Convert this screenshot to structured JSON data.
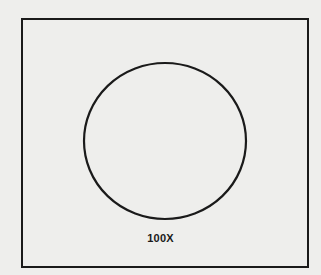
{
  "diagram": {
    "magnification_label": "100X",
    "shapes": [
      {
        "type": "rectangle",
        "role": "frame",
        "x": 21,
        "y": 18,
        "width": 286,
        "height": 248
      },
      {
        "type": "circle",
        "role": "field-of-view",
        "cx": 165,
        "cy": 141,
        "rx": 81,
        "ry": 78
      }
    ],
    "colors": {
      "background": "#eeeeec",
      "stroke": "#1a1a1a"
    }
  }
}
